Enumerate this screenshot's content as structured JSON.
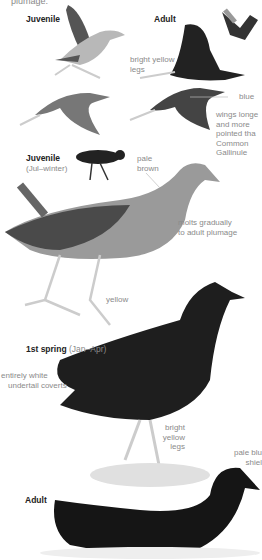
{
  "page": {
    "top_caption_fragment": "plumage.",
    "sections": [
      {
        "id": "juvenile-top",
        "title": "Juvenile"
      },
      {
        "id": "adult-top",
        "title": "Adult"
      },
      {
        "id": "juvenile-mid",
        "title": "Juvenile",
        "subtitle": "(Jul–winter)"
      },
      {
        "id": "first-spring",
        "title": "1st spring",
        "subtitle": "(Jan–Apr)"
      },
      {
        "id": "adult-bottom",
        "title": "Adult"
      }
    ],
    "annotations": {
      "bright_yellow_legs_top": [
        "bright yellow",
        "legs"
      ],
      "blue": "blue",
      "wings": [
        "wings longe",
        "and more",
        "pointed tha",
        "Common",
        "Gallinule"
      ],
      "pale_brown": [
        "pale",
        "brown"
      ],
      "molts": [
        "molts gradually",
        "to adult plumage"
      ],
      "yellow": "yellow",
      "undertail": [
        "entirely white",
        "undertail coverts"
      ],
      "bright_yellow_legs_mid": [
        "bright",
        "yellow",
        "legs"
      ],
      "shield": [
        "pale blu",
        "shiel"
      ]
    }
  }
}
